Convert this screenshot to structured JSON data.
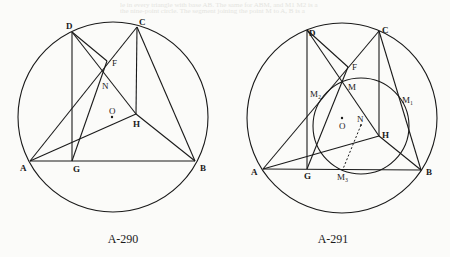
{
  "bleed_through_text": [
    "le in every triangle with base AB. The same for ABM, and M1 M2 is a",
    "the nine-point circle. The segment joining the point M to A, B is a"
  ],
  "figures": [
    {
      "caption": "A-290",
      "caption_pos": [
        123,
        243
      ],
      "circle": {
        "cx": 113,
        "cy": 117,
        "r": 95
      },
      "points": {
        "A": [
          30,
          161
        ],
        "B": [
          195,
          161
        ],
        "C": [
          137,
          27
        ],
        "D": [
          72,
          32
        ],
        "F": [
          107,
          61
        ],
        "G": [
          72,
          161
        ],
        "H": [
          136,
          114
        ],
        "N": [
          101,
          75
        ],
        "O": [
          112,
          117
        ]
      },
      "segments": [
        [
          "A",
          "B"
        ],
        [
          "A",
          "C"
        ],
        [
          "A",
          "H"
        ],
        [
          "C",
          "B"
        ],
        [
          "H",
          "B"
        ],
        [
          "C",
          "H"
        ],
        [
          "D",
          "G"
        ],
        [
          "D",
          "H"
        ],
        [
          "D",
          "F"
        ],
        [
          "G",
          "F"
        ]
      ],
      "labels": [
        {
          "text": "D",
          "x": 66,
          "y": 29
        },
        {
          "text": "C",
          "x": 139,
          "y": 25
        },
        {
          "text": "F",
          "x": 112,
          "y": 66
        },
        {
          "text": "N",
          "x": 102,
          "y": 89
        },
        {
          "text": "O",
          "x": 109,
          "y": 114
        },
        {
          "text": "H",
          "x": 133,
          "y": 127
        },
        {
          "text": "A",
          "x": 20,
          "y": 171
        },
        {
          "text": "G",
          "x": 73,
          "y": 172
        },
        {
          "text": "B",
          "x": 200,
          "y": 171
        }
      ]
    },
    {
      "caption": "A-291",
      "caption_pos": [
        333,
        243
      ],
      "circle": {
        "cx": 342,
        "cy": 118,
        "r": 95
      },
      "nine_point_circle": {
        "cx": 361,
        "cy": 126,
        "r": 48
      },
      "points": {
        "A": [
          263,
          169
        ],
        "B": [
          421,
          170
        ],
        "C": [
          379,
          31
        ],
        "D": [
          307,
          30
        ],
        "F": [
          348,
          67
        ],
        "G": [
          307,
          169
        ],
        "H": [
          379,
          136
        ],
        "M": [
          342,
          83
        ],
        "N": [
          361,
          125
        ],
        "O": [
          342,
          118
        ],
        "M1": [
          405,
          100
        ],
        "M2": [
          321,
          100
        ],
        "M3": [
          343,
          169
        ]
      },
      "segments": [
        [
          "A",
          "B"
        ],
        [
          "A",
          "C"
        ],
        [
          "A",
          "H"
        ],
        [
          "C",
          "B"
        ],
        [
          "H",
          "B"
        ],
        [
          "C",
          "H"
        ],
        [
          "D",
          "G"
        ],
        [
          "D",
          "H"
        ],
        [
          "D",
          "F"
        ],
        [
          "G",
          "F"
        ]
      ],
      "dashed": [
        [
          "N",
          "M3"
        ]
      ],
      "labels": [
        {
          "text": "D",
          "x": 309,
          "y": 36
        },
        {
          "text": "C",
          "x": 382,
          "y": 33
        },
        {
          "text": "F",
          "x": 352,
          "y": 70
        },
        {
          "text": "M",
          "x": 348,
          "y": 90
        },
        {
          "text": "M₂",
          "x": 310,
          "y": 97
        },
        {
          "text": "M₁",
          "x": 402,
          "y": 103
        },
        {
          "text": "O",
          "x": 339,
          "y": 129
        },
        {
          "text": "N",
          "x": 357,
          "y": 122
        },
        {
          "text": "H",
          "x": 382,
          "y": 138
        },
        {
          "text": "A",
          "x": 251,
          "y": 175
        },
        {
          "text": "G",
          "x": 304,
          "y": 179
        },
        {
          "text": "M₃",
          "x": 337,
          "y": 180
        },
        {
          "text": "B",
          "x": 426,
          "y": 175
        }
      ]
    }
  ],
  "colors": {
    "ink": "#1a1a1a",
    "paper": "#fbfbf9"
  }
}
